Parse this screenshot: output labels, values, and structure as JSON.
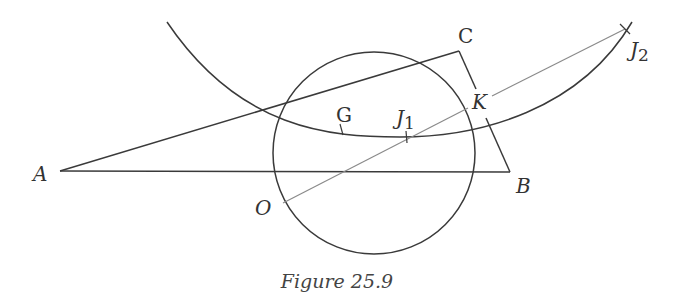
{
  "figure": {
    "caption": "Figure 25.9",
    "colors": {
      "stroke": "#3a3a3a",
      "construction": "#8a8a8a",
      "label": "#333333",
      "background": "#ffffff"
    },
    "points": {
      "A": {
        "label": "A",
        "x": 60,
        "y": 171
      },
      "B": {
        "label": "B",
        "x": 510,
        "y": 172
      },
      "C": {
        "label": "C",
        "x": 459,
        "y": 51
      },
      "O": {
        "label": "O",
        "x": 283,
        "y": 203
      },
      "G": {
        "label": "G",
        "x": 342,
        "y": 130
      },
      "J1": {
        "label": "J",
        "sub": "1",
        "x": 407,
        "y": 137
      },
      "K": {
        "label": "K",
        "x": 463,
        "y": 103
      },
      "J2": {
        "label": "J",
        "sub": "2",
        "x": 626,
        "y": 29
      }
    },
    "circle": {
      "cx": 374,
      "cy": 153,
      "r": 101
    },
    "labels": {
      "A": "A",
      "B": "B",
      "C": "C",
      "O": "O",
      "G": "G",
      "J1_main": "J",
      "J1_sub": "1",
      "K": "K",
      "J2_main": "J",
      "J2_sub": "2"
    }
  }
}
